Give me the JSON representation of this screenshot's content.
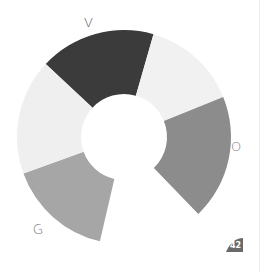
{
  "wheel": {
    "center": [
      124,
      137
    ],
    "outer_radius": 107,
    "inner_radius": 43,
    "segments": [
      {
        "name": "V",
        "start_bearing": -47,
        "end_bearing": 16,
        "color": "#3b3b3b"
      },
      {
        "name": "",
        "start_bearing": 16,
        "end_bearing": 68,
        "color": "#f1f1f1"
      },
      {
        "name": "O",
        "start_bearing": 68,
        "end_bearing": 136,
        "color": "#8c8c8c"
      },
      {
        "name": "",
        "start_bearing": 193,
        "end_bearing": 250,
        "color": "#a6a6a6"
      },
      {
        "name": "",
        "start_bearing": 250,
        "end_bearing": 313,
        "color": "#efefef"
      }
    ]
  },
  "labels": {
    "top": "V",
    "right": "O",
    "bottom_left": "G"
  },
  "badge": {
    "text": "42",
    "color": "#6a6a6a"
  }
}
